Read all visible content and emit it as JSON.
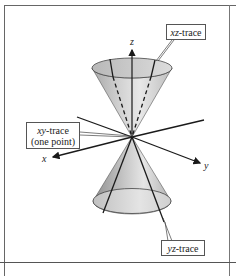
{
  "figure": {
    "axes": {
      "x_label": "x",
      "y_label": "y",
      "z_label": "z"
    },
    "callouts": {
      "xz_trace": {
        "var": "xz",
        "suffix": "-trace"
      },
      "yz_trace": {
        "var": "yz",
        "suffix": "-trace"
      },
      "xy_trace": {
        "var": "xy",
        "suffix": "-trace",
        "line2": "(one point)"
      }
    },
    "colors": {
      "frame": "#555555",
      "cone_fill_light": "#e6e6e6",
      "cone_fill_dark": "#9a9a9a",
      "lines": "#1a1a1a"
    }
  }
}
